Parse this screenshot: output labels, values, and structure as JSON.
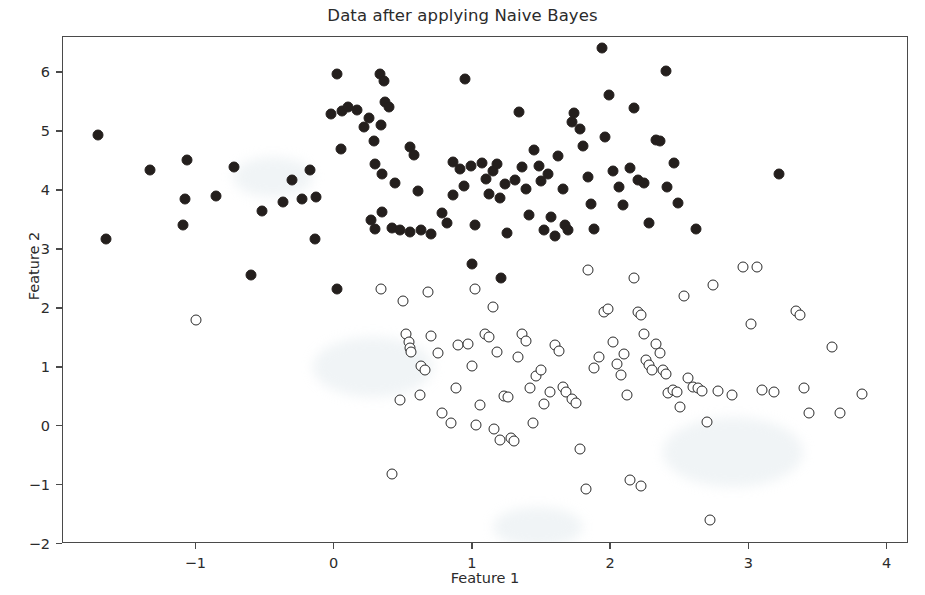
{
  "chart_data": {
    "type": "scatter",
    "title": "Data after applying Naive Bayes",
    "xlabel": "Feature 1",
    "ylabel": "Feature 2",
    "xlim": [
      -1.96,
      4.16
    ],
    "ylim": [
      -2.0,
      6.6
    ],
    "xticks": [
      -1,
      0,
      1,
      2,
      3,
      4
    ],
    "xtick_labels": [
      "−1",
      "0",
      "1",
      "2",
      "3",
      "4"
    ],
    "yticks": [
      -2,
      -1,
      0,
      1,
      2,
      3,
      4,
      5,
      6
    ],
    "ytick_labels": [
      "−2",
      "−1",
      "0",
      "1",
      "2",
      "3",
      "4",
      "5",
      "6"
    ],
    "grid": false,
    "legend": null,
    "marker_colors": {
      "class_1_fill": "#241f1d",
      "class_0_fill": "#ffffff",
      "class_0_edge": "#2a2a2a",
      "axis": "#4a4a4a",
      "text": "#2b2b2b",
      "background": "#ffffff"
    },
    "series": [
      {
        "name": "class-1-filled",
        "marker": "filled-circle",
        "points": [
          [
            -1.71,
            4.93
          ],
          [
            -1.65,
            3.17
          ],
          [
            -1.33,
            4.34
          ],
          [
            -1.06,
            4.51
          ],
          [
            -1.08,
            3.86
          ],
          [
            -1.09,
            3.41
          ],
          [
            -0.85,
            3.91
          ],
          [
            -0.72,
            4.39
          ],
          [
            -0.6,
            2.56
          ],
          [
            -0.52,
            3.65
          ],
          [
            -0.37,
            3.8
          ],
          [
            -0.3,
            4.17
          ],
          [
            -0.23,
            3.86
          ],
          [
            -0.17,
            4.34
          ],
          [
            -0.13,
            3.89
          ],
          [
            -0.14,
            3.18
          ],
          [
            -0.02,
            5.3
          ],
          [
            0.02,
            5.98
          ],
          [
            0.06,
            5.35
          ],
          [
            0.1,
            5.41
          ],
          [
            0.05,
            4.7
          ],
          [
            0.02,
            2.33
          ],
          [
            0.17,
            5.37
          ],
          [
            0.22,
            5.07
          ],
          [
            0.25,
            5.22
          ],
          [
            0.29,
            4.84
          ],
          [
            0.3,
            4.44
          ],
          [
            0.27,
            3.49
          ],
          [
            0.33,
            5.98
          ],
          [
            0.36,
            5.86
          ],
          [
            0.37,
            5.5
          ],
          [
            0.34,
            5.1
          ],
          [
            0.35,
            4.28
          ],
          [
            0.35,
            3.63
          ],
          [
            0.3,
            3.34
          ],
          [
            0.4,
            5.41
          ],
          [
            0.44,
            4.12
          ],
          [
            0.42,
            3.36
          ],
          [
            0.48,
            3.32
          ],
          [
            0.55,
            3.3
          ],
          [
            0.55,
            4.74
          ],
          [
            0.58,
            4.6
          ],
          [
            0.61,
            3.99
          ],
          [
            0.63,
            3.32
          ],
          [
            0.7,
            3.25
          ],
          [
            0.78,
            3.62
          ],
          [
            0.82,
            3.45
          ],
          [
            0.86,
            4.48
          ],
          [
            0.86,
            3.92
          ],
          [
            0.91,
            4.36
          ],
          [
            0.95,
            5.89
          ],
          [
            0.94,
            4.08
          ],
          [
            0.99,
            4.41
          ],
          [
            1.02,
            3.41
          ],
          [
            1.0,
            2.75
          ],
          [
            1.07,
            4.47
          ],
          [
            1.1,
            4.19
          ],
          [
            1.12,
            3.94
          ],
          [
            1.15,
            4.33
          ],
          [
            1.18,
            4.44
          ],
          [
            1.2,
            3.87
          ],
          [
            1.24,
            4.1
          ],
          [
            1.25,
            3.28
          ],
          [
            1.21,
            2.52
          ],
          [
            1.31,
            4.17
          ],
          [
            1.34,
            5.32
          ],
          [
            1.36,
            4.39
          ],
          [
            1.39,
            4.02
          ],
          [
            1.41,
            3.58
          ],
          [
            1.45,
            4.69
          ],
          [
            1.48,
            4.42
          ],
          [
            1.5,
            4.15
          ],
          [
            1.52,
            3.33
          ],
          [
            1.55,
            4.28
          ],
          [
            1.57,
            3.54
          ],
          [
            1.6,
            3.22
          ],
          [
            1.62,
            4.58
          ],
          [
            1.66,
            4.03
          ],
          [
            1.67,
            3.41
          ],
          [
            1.69,
            3.33
          ],
          [
            1.72,
            5.16
          ],
          [
            1.74,
            5.31
          ],
          [
            1.78,
            5.04
          ],
          [
            1.8,
            4.75
          ],
          [
            1.84,
            4.23
          ],
          [
            1.86,
            3.77
          ],
          [
            1.88,
            3.34
          ],
          [
            1.94,
            6.42
          ],
          [
            1.96,
            4.9
          ],
          [
            1.99,
            5.61
          ],
          [
            2.02,
            4.32
          ],
          [
            2.06,
            4.06
          ],
          [
            2.09,
            3.75
          ],
          [
            2.14,
            4.38
          ],
          [
            2.17,
            5.39
          ],
          [
            2.2,
            4.17
          ],
          [
            2.24,
            4.12
          ],
          [
            2.28,
            3.44
          ],
          [
            2.33,
            4.85
          ],
          [
            2.36,
            4.84
          ],
          [
            2.4,
            6.02
          ],
          [
            2.41,
            4.06
          ],
          [
            2.46,
            4.46
          ],
          [
            2.49,
            3.78
          ],
          [
            2.62,
            3.34
          ],
          [
            3.22,
            4.28
          ]
        ]
      },
      {
        "name": "class-0-open",
        "marker": "open-circle",
        "points": [
          [
            -1.0,
            1.8
          ],
          [
            0.5,
            2.13
          ],
          [
            0.52,
            1.56
          ],
          [
            0.54,
            1.43
          ],
          [
            0.55,
            1.33
          ],
          [
            0.56,
            1.26
          ],
          [
            0.68,
            2.28
          ],
          [
            0.7,
            1.53
          ],
          [
            0.75,
            1.24
          ],
          [
            0.48,
            0.44
          ],
          [
            0.42,
            -0.81
          ],
          [
            0.62,
            0.53
          ],
          [
            0.78,
            0.23
          ],
          [
            0.85,
            0.06
          ],
          [
            0.88,
            0.65
          ],
          [
            0.9,
            1.38
          ],
          [
            0.97,
            1.4
          ],
          [
            1.0,
            1.02
          ],
          [
            1.03,
            0.02
          ],
          [
            1.06,
            0.36
          ],
          [
            1.09,
            1.56
          ],
          [
            1.12,
            1.51
          ],
          [
            1.15,
            2.02
          ],
          [
            1.18,
            1.26
          ],
          [
            1.16,
            -0.05
          ],
          [
            1.2,
            -0.24
          ],
          [
            1.23,
            0.51
          ],
          [
            1.26,
            0.49
          ],
          [
            1.28,
            -0.21
          ],
          [
            1.3,
            -0.25
          ],
          [
            1.33,
            1.18
          ],
          [
            1.36,
            1.56
          ],
          [
            1.39,
            1.45
          ],
          [
            1.42,
            0.65
          ],
          [
            1.46,
            0.85
          ],
          [
            1.5,
            0.96
          ],
          [
            1.52,
            0.38
          ],
          [
            1.56,
            0.58
          ],
          [
            1.6,
            1.38
          ],
          [
            1.63,
            1.27
          ],
          [
            1.66,
            0.66
          ],
          [
            1.68,
            0.58
          ],
          [
            1.72,
            0.46
          ],
          [
            1.75,
            0.4
          ],
          [
            1.78,
            -0.39
          ],
          [
            1.82,
            -1.06
          ],
          [
            1.84,
            2.65
          ],
          [
            1.88,
            0.98
          ],
          [
            1.92,
            1.18
          ],
          [
            1.95,
            1.93
          ],
          [
            1.98,
            1.98
          ],
          [
            2.02,
            1.42
          ],
          [
            2.05,
            1.06
          ],
          [
            2.08,
            0.86
          ],
          [
            2.1,
            1.23
          ],
          [
            2.12,
            0.52
          ],
          [
            2.14,
            -0.92
          ],
          [
            2.17,
            2.51
          ],
          [
            2.2,
            1.93
          ],
          [
            2.22,
            1.88
          ],
          [
            2.24,
            1.56
          ],
          [
            2.26,
            1.12
          ],
          [
            2.28,
            1.04
          ],
          [
            2.3,
            0.96
          ],
          [
            2.22,
            -1.02
          ],
          [
            2.33,
            1.4
          ],
          [
            2.36,
            1.24
          ],
          [
            2.38,
            0.96
          ],
          [
            2.4,
            0.88
          ],
          [
            2.42,
            0.56
          ],
          [
            2.45,
            0.62
          ],
          [
            2.48,
            0.58
          ],
          [
            2.5,
            0.32
          ],
          [
            2.53,
            2.21
          ],
          [
            2.56,
            0.82
          ],
          [
            2.6,
            0.66
          ],
          [
            2.63,
            0.64
          ],
          [
            2.66,
            0.6
          ],
          [
            2.7,
            0.07
          ],
          [
            2.74,
            2.4
          ],
          [
            2.78,
            0.6
          ],
          [
            2.72,
            -1.6
          ],
          [
            2.88,
            0.52
          ],
          [
            2.96,
            2.7
          ],
          [
            3.02,
            1.74
          ],
          [
            3.06,
            2.7
          ],
          [
            3.1,
            0.62
          ],
          [
            3.18,
            0.57
          ],
          [
            3.34,
            1.95
          ],
          [
            3.37,
            1.88
          ],
          [
            3.4,
            0.65
          ],
          [
            3.44,
            0.22
          ],
          [
            3.6,
            1.34
          ],
          [
            3.66,
            0.22
          ],
          [
            3.82,
            0.55
          ],
          [
            1.02,
            2.32
          ],
          [
            0.34,
            2.32
          ],
          [
            0.63,
            1.02
          ],
          [
            0.66,
            0.96
          ],
          [
            1.44,
            0.06
          ]
        ]
      }
    ]
  }
}
